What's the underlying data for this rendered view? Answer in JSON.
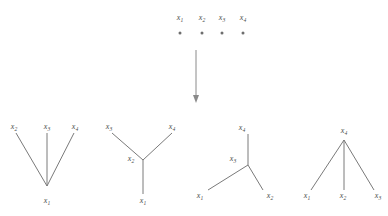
{
  "figure": {
    "background_color": "#ffffff",
    "line_color": "#7a7a7a",
    "label_color": "#4d4d4d",
    "variable_symbol": "x"
  },
  "top_row": {
    "name": "isolated-vertices-row",
    "nodes": [
      {
        "label_base": "x",
        "label_sub": "1",
        "cx": 180,
        "cy": 33,
        "label_x": 180,
        "label_y": 20
      },
      {
        "label_base": "x",
        "label_sub": "2",
        "cx": 202,
        "cy": 33,
        "label_x": 202,
        "label_y": 20
      },
      {
        "label_base": "x",
        "label_sub": "3",
        "cx": 222,
        "cy": 33,
        "label_x": 222,
        "label_y": 20
      },
      {
        "label_base": "x",
        "label_sub": "4",
        "cx": 243,
        "cy": 33,
        "label_x": 243,
        "label_y": 20
      }
    ]
  },
  "arrow": {
    "name": "downward-arrow",
    "x": 196,
    "y_start": 50,
    "y_end": 103,
    "head_width": 6,
    "head_length": 8
  },
  "trees": [
    {
      "name": "tree-star-center-x1",
      "edges": [
        {
          "x1": 16,
          "y1": 133,
          "x2": 47,
          "y2": 186
        },
        {
          "x1": 47,
          "y1": 133,
          "x2": 47,
          "y2": 186
        },
        {
          "x1": 74,
          "y1": 133,
          "x2": 47,
          "y2": 186
        }
      ],
      "labels": [
        {
          "base": "x",
          "sub": "2",
          "x": 14,
          "y": 129
        },
        {
          "base": "x",
          "sub": "3",
          "x": 47,
          "y": 129
        },
        {
          "base": "x",
          "sub": "4",
          "x": 75,
          "y": 129
        },
        {
          "base": "x",
          "sub": "1",
          "x": 47,
          "y": 203
        }
      ]
    },
    {
      "name": "tree-path-center-x2",
      "edges": [
        {
          "x1": 112,
          "y1": 133,
          "x2": 143,
          "y2": 160
        },
        {
          "x1": 172,
          "y1": 133,
          "x2": 143,
          "y2": 160
        },
        {
          "x1": 143,
          "y1": 160,
          "x2": 143,
          "y2": 194
        }
      ],
      "labels": [
        {
          "base": "x",
          "sub": "3",
          "x": 109,
          "y": 129
        },
        {
          "base": "x",
          "sub": "4",
          "x": 172,
          "y": 129
        },
        {
          "base": "x",
          "sub": "2",
          "x": 131,
          "y": 161
        },
        {
          "base": "x",
          "sub": "1",
          "x": 143,
          "y": 203
        }
      ]
    },
    {
      "name": "tree-path-center-x3",
      "edges": [
        {
          "x1": 248,
          "y1": 134,
          "x2": 248,
          "y2": 165
        },
        {
          "x1": 248,
          "y1": 165,
          "x2": 208,
          "y2": 190
        },
        {
          "x1": 248,
          "y1": 165,
          "x2": 263,
          "y2": 190
        }
      ],
      "labels": [
        {
          "base": "x",
          "sub": "4",
          "x": 242,
          "y": 130
        },
        {
          "base": "x",
          "sub": "3",
          "x": 233,
          "y": 161
        },
        {
          "base": "x",
          "sub": "1",
          "x": 200,
          "y": 198
        },
        {
          "base": "x",
          "sub": "2",
          "x": 270,
          "y": 198
        }
      ]
    },
    {
      "name": "tree-star-center-x4",
      "edges": [
        {
          "x1": 344,
          "y1": 140,
          "x2": 311,
          "y2": 190
        },
        {
          "x1": 344,
          "y1": 140,
          "x2": 344,
          "y2": 190
        },
        {
          "x1": 344,
          "y1": 140,
          "x2": 374,
          "y2": 190
        }
      ],
      "labels": [
        {
          "base": "x",
          "sub": "4",
          "x": 344,
          "y": 133
        },
        {
          "base": "x",
          "sub": "1",
          "x": 307,
          "y": 198
        },
        {
          "base": "x",
          "sub": "2",
          "x": 343,
          "y": 198
        },
        {
          "base": "x",
          "sub": "3",
          "x": 378,
          "y": 198
        }
      ]
    }
  ]
}
